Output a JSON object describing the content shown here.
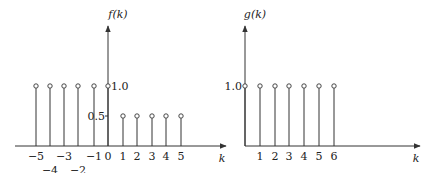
{
  "chart_data": [
    {
      "type": "stem",
      "title": "",
      "ylabel": "f(k)",
      "xlabel": "k",
      "x": [
        -5,
        -4,
        -3,
        -2,
        -1,
        0,
        1,
        2,
        3,
        4,
        5
      ],
      "values": [
        1.0,
        1.0,
        1.0,
        1.0,
        1.0,
        1.0,
        0.5,
        0.5,
        0.5,
        0.5,
        0.5
      ],
      "x_tick_labels": [
        "−5",
        "−4",
        "−3",
        "−2",
        "−1",
        "0",
        "1",
        "2",
        "3",
        "4",
        "5"
      ],
      "y_tick_labels": [
        "0.5",
        "1.0"
      ],
      "y_ticks": [
        0.5,
        1.0
      ],
      "grid": false,
      "legend": null
    },
    {
      "type": "stem",
      "title": "",
      "ylabel": "g(k)",
      "xlabel": "k",
      "x": [
        0,
        1,
        2,
        3,
        4,
        5,
        6
      ],
      "values": [
        1.0,
        1.0,
        1.0,
        1.0,
        1.0,
        1.0,
        1.0
      ],
      "x_tick_labels": [
        "1",
        "2",
        "3",
        "4",
        "5",
        "6"
      ],
      "y_tick_labels": [
        "1.0"
      ],
      "y_ticks": [
        1.0
      ],
      "grid": false,
      "legend": null
    }
  ],
  "layout": {
    "f": {
      "origin_x": 108,
      "axis_y": 146,
      "unit_y": 60,
      "x_positions": [
        36,
        50,
        64,
        78,
        94,
        108,
        123,
        137,
        152,
        166,
        181
      ],
      "x_axis_from": 15,
      "x_axis_to": 226,
      "y_axis_top": 26,
      "tick_label_rows": [
        0,
        1,
        0,
        1,
        0,
        0,
        0,
        0,
        0,
        0,
        0
      ]
    },
    "g": {
      "origin_x": 245,
      "axis_y": 146,
      "unit_y": 60,
      "x_positions": [
        245,
        260,
        275,
        289,
        304,
        319,
        334
      ],
      "x_axis_from": 245,
      "x_axis_to": 420,
      "y_axis_top": 26
    }
  }
}
